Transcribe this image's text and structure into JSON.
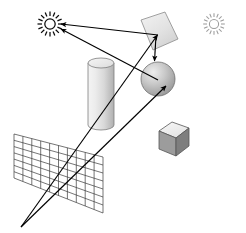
{
  "figure": {
    "background_color": "#ffffff",
    "width": 246,
    "height": 233,
    "stroke_color": "#000000"
  },
  "lights": [
    {
      "name": "primary-light",
      "label": "sun",
      "cx": 50,
      "cy": 24,
      "core_radius": 5.2,
      "ray_count": 16,
      "ray_length": 10.5,
      "color": "#0a0a0a",
      "intensity": "active"
    },
    {
      "name": "secondary-light",
      "label": "sun",
      "cx": 214,
      "cy": 24,
      "core_radius": 4.6,
      "ray_count": 16,
      "ray_length": 9.0,
      "color": "#9b9b9b",
      "intensity": "dim"
    }
  ],
  "objects": [
    {
      "name": "mirror-quad",
      "label": "reflective plane",
      "points": "141,20 165,12 178,39 153,50",
      "fill_top": "#eeeeee",
      "fill_bottom": "#d2d2d2",
      "stroke": "#8a8a8a"
    },
    {
      "name": "cylinder",
      "label": "cylinder",
      "cx": 101,
      "top_y": 63,
      "bottom_y": 125,
      "rx": 13,
      "ry": 5,
      "fill_left": "#f2f2f2",
      "fill_mid": "#e2e2e2",
      "fill_right": "#b4b4b4",
      "cap_fill": "#efefef",
      "stroke": "#7d7d7d"
    },
    {
      "name": "sphere",
      "label": "sphere",
      "cx": 158,
      "cy": 79,
      "r": 17,
      "fill_light": "#e8e8e8",
      "fill_mid": "#b8b8b8",
      "fill_dark": "#8e8e8e",
      "stroke": "#6f6f6f"
    },
    {
      "name": "cube",
      "label": "cube",
      "top_face": "159,131 172,122 189,128 176,138",
      "left_face": "159,131 176,138 176,156 159,149",
      "right_face": "176,138 189,128 189,146 176,156",
      "fill_top": "#f0f0f0",
      "fill_left": "#9c9c9c",
      "fill_right": "#7e7e7e",
      "stroke": "#555555"
    }
  ],
  "image_plane": {
    "name": "image-plane-grid",
    "label": "view plane grid",
    "corners": {
      "top_left": "14,134",
      "top_right": "103,157",
      "bottom_right": "103,213",
      "bottom_left": "14,178"
    },
    "columns": 10,
    "rows": 7,
    "stroke": "#3a3a3a",
    "stroke_width": 0.7
  },
  "viewpoint": {
    "name": "eye-point",
    "label": "eye",
    "x": 21,
    "y": 227
  },
  "rays": [
    {
      "name": "eye-ray-to-sphere",
      "type": "primary",
      "from": "21,227",
      "to": "166,86",
      "arrow": true,
      "color": "#000000"
    },
    {
      "name": "eye-ray-to-mirror",
      "type": "primary",
      "from": "21,227",
      "to": "157,34",
      "arrow": true,
      "color": "#000000"
    },
    {
      "name": "shadow-ray-sphere-to-light",
      "type": "shadow",
      "from": "158,79",
      "to": "60,29",
      "arrow": true,
      "color": "#000000"
    },
    {
      "name": "shadow-ray-mirror-to-light",
      "type": "shadow",
      "from": "157,34",
      "to": "60,24",
      "arrow": true,
      "color": "#000000"
    },
    {
      "name": "reflection-ray-mirror-to-sphere",
      "type": "reflection",
      "from": "157,34",
      "to": "155,62",
      "arrow": true,
      "color": "#000000"
    }
  ]
}
